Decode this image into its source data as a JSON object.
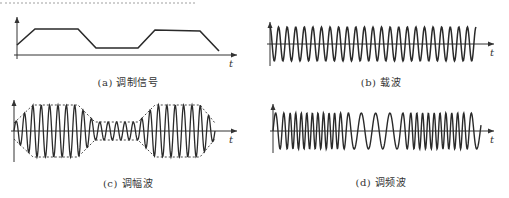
{
  "panels": [
    {
      "id": "a",
      "caption": "(a) 调制信号",
      "axis_label": "t"
    },
    {
      "id": "b",
      "caption": "(b) 载波",
      "axis_label": "t"
    },
    {
      "id": "c",
      "caption": "(c) 调幅波",
      "axis_label": "t"
    },
    {
      "id": "d",
      "caption": "(d) 调频波",
      "axis_label": "t"
    }
  ],
  "colors": {
    "line": "#2a2a2a",
    "axis": "#333333",
    "envelope": "#333333"
  },
  "geometry": {
    "a": {
      "x0": 17,
      "x1": 237,
      "baseline": 55,
      "top": 17,
      "signal": [
        [
          17,
          45
        ],
        [
          35,
          29
        ],
        [
          78,
          29
        ],
        [
          96,
          48
        ],
        [
          138,
          48
        ],
        [
          155,
          30
        ],
        [
          200,
          31
        ],
        [
          219,
          51
        ]
      ]
    },
    "b": {
      "x0": 270,
      "x1": 494,
      "center": 44,
      "top": 22,
      "amp": 17,
      "start": 270,
      "end": 476,
      "cycles": 24
    },
    "c": {
      "x0": 14,
      "x1": 237,
      "center": 131,
      "top": 100,
      "bottom": 162,
      "envelope": [
        [
          14,
          8
        ],
        [
          33,
          26
        ],
        [
          78,
          26
        ],
        [
          95,
          9
        ],
        [
          138,
          9
        ],
        [
          155,
          26
        ],
        [
          200,
          26
        ],
        [
          215,
          8
        ]
      ],
      "start": 14,
      "end": 215,
      "cycles": 24
    },
    "d": {
      "x0": 273,
      "x1": 494,
      "center": 131,
      "top": 104,
      "amp": 18,
      "start": 273,
      "end": 481
    }
  }
}
